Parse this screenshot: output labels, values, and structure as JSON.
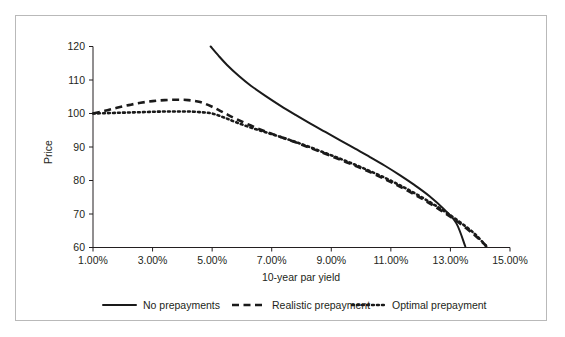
{
  "chart_data": {
    "type": "line",
    "title": "",
    "xlabel": "10-year par yield",
    "ylabel": "Price",
    "xlim": [
      1,
      15
    ],
    "ylim": [
      60,
      120
    ],
    "grid": false,
    "legend_position": "bottom",
    "x_tick_labels": [
      "1.00%",
      "3.00%",
      "5.00%",
      "7.00%",
      "9.00%",
      "11.00%",
      "13.00%",
      "15.00%"
    ],
    "x_tick_values": [
      1,
      3,
      5,
      7,
      9,
      11,
      13,
      15
    ],
    "y_tick_labels": [
      "60",
      "70",
      "80",
      "90",
      "100",
      "110",
      "120"
    ],
    "y_tick_values": [
      60,
      70,
      80,
      90,
      100,
      110,
      120
    ],
    "series": [
      {
        "name": "No prepayments",
        "style": "solid",
        "color": "#1a1a1a",
        "x": [
          4.95,
          5.2,
          5.5,
          5.9,
          6.3,
          6.8,
          7.3,
          7.8,
          8.3,
          8.8,
          9.3,
          9.8,
          10.3,
          10.8,
          11.3,
          11.8,
          12.3,
          12.8,
          13.2,
          13.5
        ],
        "y": [
          120.0,
          117.4,
          114.5,
          111.2,
          108.3,
          105.2,
          102.3,
          99.6,
          97.0,
          94.5,
          92.0,
          89.5,
          87.0,
          84.4,
          81.6,
          78.6,
          75.3,
          71.3,
          67.2,
          60.3
        ]
      },
      {
        "name": "Realistic prepayment",
        "style": "dashed",
        "color": "#1a1a1a",
        "x": [
          1.0,
          1.4,
          1.8,
          2.2,
          2.6,
          3.0,
          3.4,
          3.8,
          4.2,
          4.6,
          5.0,
          5.4,
          5.8,
          6.3,
          6.8,
          7.3,
          7.8,
          8.3,
          8.8,
          9.3,
          9.8,
          10.3,
          10.8,
          11.3,
          11.8,
          12.3,
          12.8,
          13.3,
          13.8,
          14.2
        ],
        "y": [
          100.0,
          100.8,
          101.7,
          102.5,
          103.2,
          103.7,
          104.0,
          104.1,
          104.0,
          103.4,
          102.0,
          100.2,
          98.4,
          96.4,
          94.6,
          93.0,
          91.4,
          89.7,
          88.0,
          86.2,
          84.4,
          82.5,
          80.4,
          78.2,
          75.8,
          73.2,
          70.4,
          67.3,
          63.8,
          60.5
        ]
      },
      {
        "name": "Optimal prepayment",
        "style": "dotted",
        "color": "#1a1a1a",
        "x": [
          1.0,
          1.4,
          1.8,
          2.2,
          2.6,
          3.0,
          3.4,
          3.8,
          4.2,
          4.6,
          5.0,
          5.4,
          5.8,
          6.3,
          6.8,
          7.3,
          7.8,
          8.3,
          8.8,
          9.3,
          9.8,
          10.3,
          10.8,
          11.3,
          11.8,
          12.3,
          12.8,
          13.3,
          13.8,
          14.2
        ],
        "y": [
          100.0,
          100.1,
          100.2,
          100.3,
          100.4,
          100.5,
          100.6,
          100.6,
          100.6,
          100.4,
          100.0,
          98.8,
          97.4,
          95.8,
          94.4,
          93.0,
          91.5,
          89.9,
          88.2,
          86.5,
          84.7,
          82.8,
          80.8,
          78.6,
          76.2,
          73.6,
          70.8,
          67.7,
          64.2,
          60.4
        ]
      }
    ]
  },
  "legend": {
    "items": [
      {
        "label": "No prepayments",
        "style": "solid"
      },
      {
        "label": "Realistic prepayment",
        "style": "dashed"
      },
      {
        "label": "Optimal prepayment",
        "style": "dotted"
      }
    ]
  },
  "colors": {
    "ink": "#231f20",
    "series": "#1a1a1a",
    "frame": "#b9b9b9",
    "background": "#ffffff"
  }
}
